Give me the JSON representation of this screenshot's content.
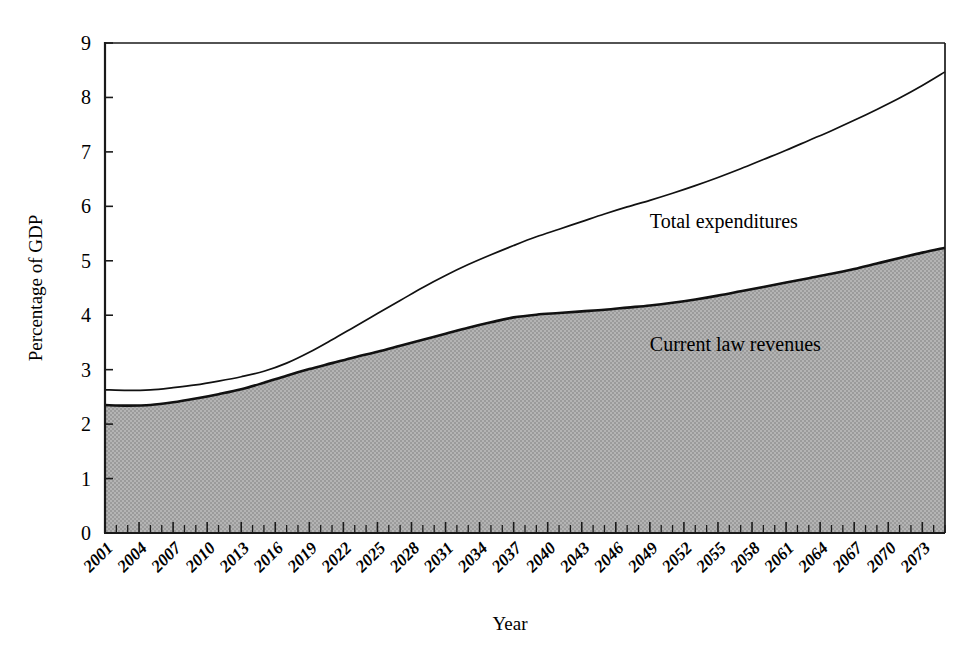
{
  "figure": {
    "background": "#ffffff",
    "plot_left": 105,
    "plot_right": 945,
    "plot_top": 43,
    "plot_bottom": 533
  },
  "labels": {
    "y_axis_title": "Percentage of GDP",
    "x_axis_title": "Year",
    "series_top_label": "Total expenditures",
    "series_bottom_label": "Current law revenues"
  },
  "chart_data": {
    "type": "area",
    "title": "",
    "subtitle": "",
    "xlabel": "Year",
    "ylabel": "Percentage of GDP",
    "xlim": [
      2001,
      2075
    ],
    "ylim": [
      0,
      9
    ],
    "ytick_step": 1,
    "yticks": [
      0,
      1,
      2,
      3,
      4,
      5,
      6,
      7,
      8,
      9
    ],
    "ytick_labels": [
      "0",
      "1",
      "2",
      "3",
      "4",
      "5",
      "6",
      "7",
      "8",
      "9"
    ],
    "xticks": [
      2001,
      2004,
      2007,
      2010,
      2013,
      2016,
      2019,
      2022,
      2025,
      2028,
      2031,
      2034,
      2037,
      2040,
      2043,
      2046,
      2049,
      2052,
      2055,
      2058,
      2061,
      2064,
      2067,
      2070,
      2073
    ],
    "xtick_labels": [
      "2001",
      "2004",
      "2007",
      "2010",
      "2013",
      "2016",
      "2019",
      "2022",
      "2025",
      "2028",
      "2031",
      "2034",
      "2037",
      "2040",
      "2043",
      "2046",
      "2049",
      "2052",
      "2055",
      "2058",
      "2061",
      "2064",
      "2067",
      "2070",
      "2073"
    ],
    "xtick_minor_step": 1,
    "xtick_label_rotation": -45,
    "grid": false,
    "legend_position": "inline-annotation",
    "x": [
      2001,
      2003,
      2005,
      2007,
      2009,
      2011,
      2013,
      2015,
      2017,
      2019,
      2021,
      2023,
      2025,
      2027,
      2029,
      2031,
      2033,
      2035,
      2037,
      2039,
      2041,
      2043,
      2045,
      2047,
      2049,
      2051,
      2053,
      2055,
      2057,
      2059,
      2061,
      2063,
      2065,
      2067,
      2069,
      2071,
      2073,
      2075
    ],
    "series": [
      {
        "name": "Total expenditures",
        "style": "line",
        "color": "#111111",
        "line_width": 1.7,
        "values": [
          2.63,
          2.62,
          2.63,
          2.67,
          2.72,
          2.79,
          2.87,
          2.97,
          3.12,
          3.32,
          3.55,
          3.79,
          4.03,
          4.27,
          4.51,
          4.73,
          4.93,
          5.11,
          5.28,
          5.44,
          5.58,
          5.72,
          5.86,
          5.99,
          6.11,
          6.24,
          6.38,
          6.53,
          6.69,
          6.86,
          7.03,
          7.21,
          7.39,
          7.58,
          7.78,
          7.99,
          8.22,
          8.47
        ]
      },
      {
        "name": "Current law revenues",
        "style": "area",
        "color": "#111111",
        "fill": "#a9a9a9",
        "line_width": 2.6,
        "values": [
          2.35,
          2.34,
          2.35,
          2.4,
          2.47,
          2.55,
          2.64,
          2.76,
          2.89,
          3.01,
          3.12,
          3.23,
          3.33,
          3.44,
          3.55,
          3.66,
          3.77,
          3.87,
          3.96,
          4.01,
          4.04,
          4.07,
          4.1,
          4.14,
          4.18,
          4.23,
          4.29,
          4.36,
          4.44,
          4.52,
          4.6,
          4.68,
          4.76,
          4.85,
          4.95,
          5.05,
          5.15,
          5.24
        ]
      }
    ],
    "annotations": [
      {
        "text": "Total expenditures",
        "x": 2049,
        "y": 5.6
      },
      {
        "text": "Current law revenues",
        "x": 2049,
        "y": 3.35
      }
    ]
  },
  "colors": {
    "ink": "#111111",
    "fill_gray": "#a9a9a9",
    "background": "#ffffff"
  }
}
